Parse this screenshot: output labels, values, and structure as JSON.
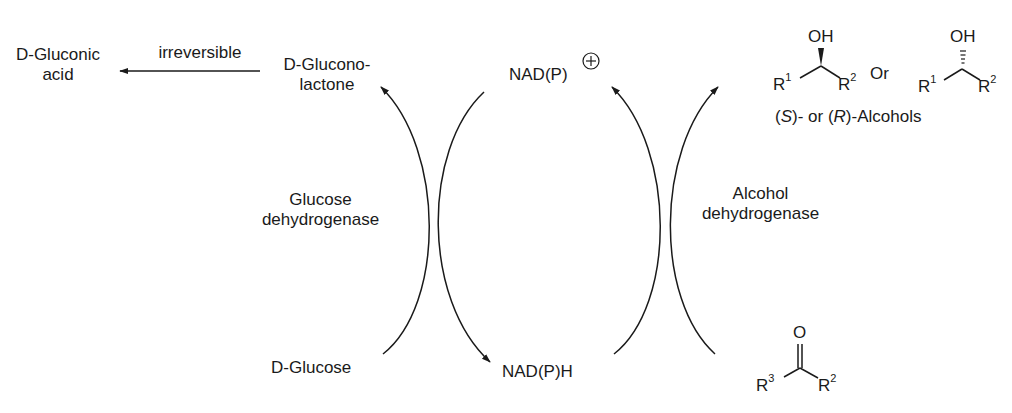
{
  "left_cycle": {
    "product_acid": {
      "line1": "D-Gluconic",
      "line2": "acid"
    },
    "irreversible_label": "irreversible",
    "lactone": {
      "line1": "D-Glucono-",
      "line2": "lactone"
    },
    "enzyme": {
      "line1": "Glucose",
      "line2": "dehydrogenase"
    },
    "substrate": "D-Glucose"
  },
  "cofactor": {
    "oxidized": "NAD(P)",
    "oxidized_charge": "+",
    "reduced": "NAD(P)H"
  },
  "right_cycle": {
    "enzyme": {
      "line1": "Alcohol",
      "line2": "dehydrogenase"
    },
    "alcohol_s": {
      "top": "OH",
      "r_left": "R",
      "r_left_sup": "1",
      "r_right": "R",
      "r_right_sup": "2"
    },
    "or_label": "Or",
    "alcohol_r": {
      "top": "OH",
      "r_left": "R",
      "r_left_sup": "1",
      "r_right": "R",
      "r_right_sup": "2"
    },
    "alcohols_caption": {
      "s": "S",
      "mid": ")- or (",
      "r": "R",
      "end": ")-Alcohols",
      "open": "("
    },
    "ketone": {
      "top": "O",
      "r_left": "R",
      "r_left_sup": "3",
      "r_right": "R",
      "r_right_sup": "2"
    }
  },
  "colors": {
    "ink": "#1a1a1a",
    "background": "#ffffff"
  }
}
